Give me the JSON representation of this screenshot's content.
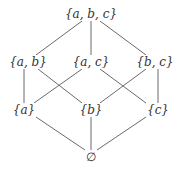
{
  "diagram": {
    "type": "hasse-diagram",
    "nodes": [
      {
        "id": "abc",
        "label": "{a, b, c}",
        "x": 90,
        "y": 14
      },
      {
        "id": "ab",
        "label": "{a, b}",
        "x": 30,
        "y": 62
      },
      {
        "id": "ac",
        "label": "{a, c}",
        "x": 90,
        "y": 62
      },
      {
        "id": "bc",
        "label": "{b, c}",
        "x": 150,
        "y": 62
      },
      {
        "id": "a",
        "label": "{a}",
        "x": 30,
        "y": 110
      },
      {
        "id": "b",
        "label": "{b}",
        "x": 90,
        "y": 110
      },
      {
        "id": "c",
        "label": "{c}",
        "x": 150,
        "y": 110
      },
      {
        "id": "empty",
        "label": "∅",
        "x": 90,
        "y": 157
      }
    ],
    "edges": [
      [
        "abc",
        "ab"
      ],
      [
        "abc",
        "ac"
      ],
      [
        "abc",
        "bc"
      ],
      [
        "ab",
        "a"
      ],
      [
        "ab",
        "b"
      ],
      [
        "ac",
        "a"
      ],
      [
        "ac",
        "c"
      ],
      [
        "bc",
        "b"
      ],
      [
        "bc",
        "c"
      ],
      [
        "a",
        "empty"
      ],
      [
        "b",
        "empty"
      ],
      [
        "c",
        "empty"
      ]
    ],
    "line_color": "#6a6a6a",
    "text_color": "#333333"
  }
}
